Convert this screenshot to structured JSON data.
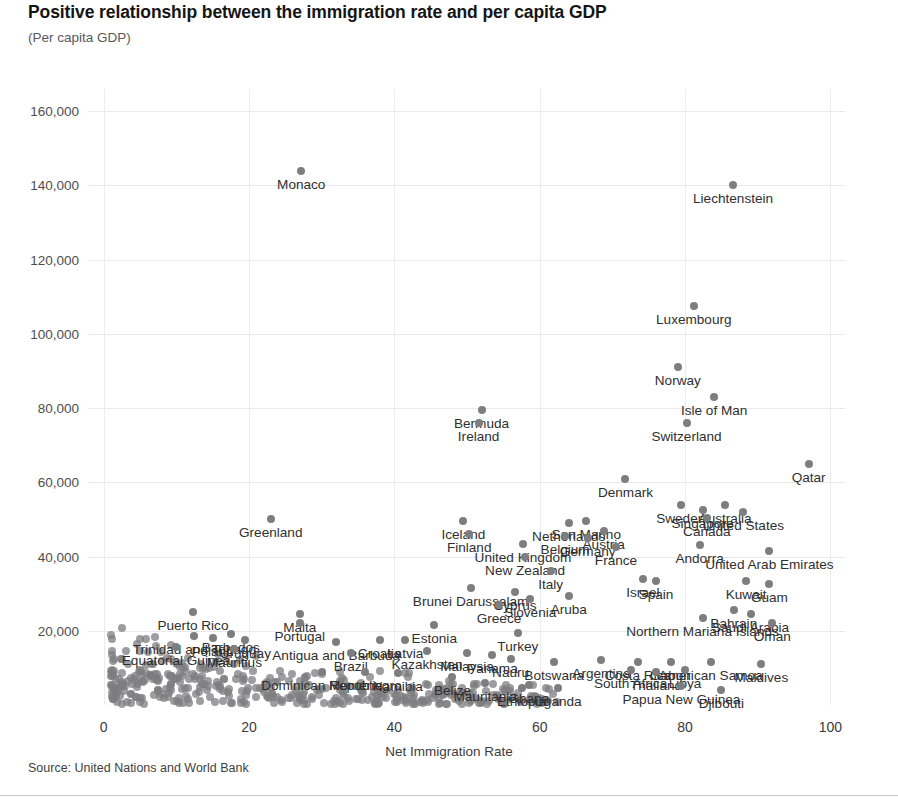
{
  "header": {
    "title": "Positive relationship between the immigration rate and per capita GDP",
    "subtitle": "(Per capita GDP)"
  },
  "footer": {
    "source": "Source: United Nations and World Bank"
  },
  "chart_data": {
    "type": "scatter",
    "title": "Positive relationship between the immigration rate and per capita GDP",
    "subtitle": "(Per capita GDP)",
    "xlabel": "Net Immigration Rate",
    "ylabel": "(Per capita GDP)",
    "xlim": [
      -2,
      102
    ],
    "ylim": [
      0,
      166000
    ],
    "xticks": [
      0,
      20,
      40,
      60,
      80,
      100
    ],
    "yticks": [
      20000,
      40000,
      60000,
      80000,
      100000,
      120000,
      140000,
      160000
    ],
    "ytick_labels": [
      "20,000",
      "40,000",
      "60,000",
      "80,000",
      "100,000",
      "120,000",
      "140,000",
      "160,000"
    ],
    "xtick_labels": [
      "0",
      "20",
      "40",
      "60",
      "80",
      "100"
    ],
    "grid": true,
    "legend": "none",
    "marker_color": "#7e7e80",
    "points": [
      {
        "label": "Monaco",
        "x": 27.2,
        "y": 144000
      },
      {
        "label": "Liechtenstein",
        "x": 86.6,
        "y": 140000
      },
      {
        "label": "Luxembourg",
        "x": 81.2,
        "y": 107500
      },
      {
        "label": "Norway",
        "x": 79.0,
        "y": 91000
      },
      {
        "label": "Isle of Man",
        "x": 84.0,
        "y": 83000
      },
      {
        "label": "Bermuda",
        "x": 52.0,
        "y": 79500
      },
      {
        "label": "Ireland",
        "x": 51.6,
        "y": 76000
      },
      {
        "label": "Switzerland",
        "x": 80.2,
        "y": 76000
      },
      {
        "label": "Qatar",
        "x": 97.0,
        "y": 65000
      },
      {
        "label": "Denmark",
        "x": 71.8,
        "y": 61000
      },
      {
        "label": "Sweden",
        "x": 79.4,
        "y": 54000
      },
      {
        "label": "Singapore",
        "x": 82.4,
        "y": 52500
      },
      {
        "label": "Australia",
        "x": 85.5,
        "y": 54000
      },
      {
        "label": "United States",
        "x": 88.0,
        "y": 52000
      },
      {
        "label": "Canada",
        "x": 83.0,
        "y": 50500
      },
      {
        "label": "Greenland",
        "x": 23.0,
        "y": 50000
      },
      {
        "label": "Iceland",
        "x": 49.5,
        "y": 49500
      },
      {
        "label": "Netherlands",
        "x": 64.0,
        "y": 49000
      },
      {
        "label": "San Marino",
        "x": 66.4,
        "y": 49500
      },
      {
        "label": "Finland",
        "x": 50.3,
        "y": 46000
      },
      {
        "label": "Austria",
        "x": 68.8,
        "y": 47000
      },
      {
        "label": "Belgium",
        "x": 63.5,
        "y": 45500
      },
      {
        "label": "Germany",
        "x": 66.6,
        "y": 45000
      },
      {
        "label": "United Kingdom",
        "x": 57.7,
        "y": 43500
      },
      {
        "label": "France",
        "x": 70.5,
        "y": 42500
      },
      {
        "label": "Andorra",
        "x": 82.0,
        "y": 43000
      },
      {
        "label": "United Arab Emirates",
        "x": 91.6,
        "y": 41500
      },
      {
        "label": "New Zealand",
        "x": 58.0,
        "y": 40000
      },
      {
        "label": "Italy",
        "x": 61.5,
        "y": 36000
      },
      {
        "label": "Israel",
        "x": 74.2,
        "y": 34000
      },
      {
        "label": "Spain",
        "x": 76.0,
        "y": 33500
      },
      {
        "label": "Kuwait",
        "x": 88.4,
        "y": 33500
      },
      {
        "label": "Guam",
        "x": 91.6,
        "y": 32500
      },
      {
        "label": "Brunei Darussalam",
        "x": 50.5,
        "y": 31500
      },
      {
        "label": "Cyprus",
        "x": 56.6,
        "y": 30500
      },
      {
        "label": "Slovenia",
        "x": 58.7,
        "y": 28500
      },
      {
        "label": "Aruba",
        "x": 64.0,
        "y": 29500
      },
      {
        "label": "Greece",
        "x": 54.4,
        "y": 27000
      },
      {
        "label": "Puerto Rico",
        "x": 12.3,
        "y": 25000
      },
      {
        "label": "Bahrain",
        "x": 86.7,
        "y": 25500
      },
      {
        "label": "Saudi Arabia",
        "x": 89.0,
        "y": 24500
      },
      {
        "label": "Malta",
        "x": 27.0,
        "y": 24500
      },
      {
        "label": "Northern Mariana Islands",
        "x": 82.4,
        "y": 23500
      },
      {
        "label": "Oman",
        "x": 92.0,
        "y": 22000
      },
      {
        "label": "Portugal",
        "x": 27.0,
        "y": 22000
      },
      {
        "label": "Estonia",
        "x": 45.5,
        "y": 21500
      },
      {
        "label": "Turkey",
        "x": 57.0,
        "y": 19500
      },
      {
        "label": "Trinidad and Tobago",
        "x": 12.5,
        "y": 18500
      },
      {
        "label": "Poland",
        "x": 15.0,
        "y": 18000
      },
      {
        "label": "Barbados",
        "x": 17.5,
        "y": 19000
      },
      {
        "label": "Uruguay",
        "x": 19.5,
        "y": 17500
      },
      {
        "label": "Antigua and Barbuda",
        "x": 32.0,
        "y": 17000
      },
      {
        "label": "Croatia",
        "x": 38.0,
        "y": 17500
      },
      {
        "label": "Latvia",
        "x": 41.5,
        "y": 17500
      },
      {
        "label": "Equatorial Guinea",
        "x": 10.0,
        "y": 15500
      },
      {
        "label": "Mauritius",
        "x": 18.0,
        "y": 15000
      },
      {
        "label": "Brazil",
        "x": 34.0,
        "y": 14000
      },
      {
        "label": "Kazakhstan",
        "x": 44.5,
        "y": 14500
      },
      {
        "label": "Malaysia",
        "x": 50.0,
        "y": 14000
      },
      {
        "label": "Panama",
        "x": 53.5,
        "y": 13500
      },
      {
        "label": "Nauru",
        "x": 56.0,
        "y": 12500
      },
      {
        "label": "Botswana",
        "x": 62.0,
        "y": 11500
      },
      {
        "label": "Argentina",
        "x": 68.5,
        "y": 12000
      },
      {
        "label": "Costa Rica",
        "x": 73.5,
        "y": 11500
      },
      {
        "label": "Gabon",
        "x": 78.0,
        "y": 11500
      },
      {
        "label": "American Samoa",
        "x": 83.5,
        "y": 11500
      },
      {
        "label": "Maldives",
        "x": 90.5,
        "y": 11000
      },
      {
        "label": "South Africa",
        "x": 72.5,
        "y": 9500
      },
      {
        "label": "Thailand",
        "x": 76.0,
        "y": 9000
      },
      {
        "label": "Libya",
        "x": 80.0,
        "y": 9500
      },
      {
        "label": "Dominican Republic",
        "x": 30.0,
        "y": 9000
      },
      {
        "label": "Montenegro",
        "x": 36.0,
        "y": 9000
      },
      {
        "label": "Namibia",
        "x": 40.5,
        "y": 8500
      },
      {
        "label": "Belize",
        "x": 48.0,
        "y": 7500
      },
      {
        "label": "Mauritania",
        "x": 52.5,
        "y": 6000
      },
      {
        "label": "Ghana",
        "x": 58.5,
        "y": 5500
      },
      {
        "label": "Ethiopia",
        "x": 57.5,
        "y": 4500
      },
      {
        "label": "Uganda",
        "x": 62.5,
        "y": 4500
      },
      {
        "label": "Papua New Guinea",
        "x": 79.5,
        "y": 5000
      },
      {
        "label": "Djibouti",
        "x": 85.0,
        "y": 4000
      }
    ],
    "unlabeled_cluster_note": "Dense overlapping cluster of additional countries along the low-GDP band"
  }
}
